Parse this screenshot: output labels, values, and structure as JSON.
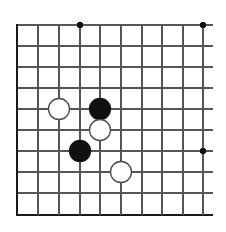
{
  "figure": {
    "kind": "go-board-diagram",
    "width": 226,
    "height": 232,
    "background_color": "#ffffff"
  },
  "board": {
    "grid_line_color": "#555555",
    "edge_line_color": "#1a1a1a",
    "grid_line_width": 1.3,
    "edge_line_width": 2.6,
    "cropped": true,
    "cropped_edges": [
      "top",
      "right"
    ],
    "columns": 10,
    "rows": 10,
    "column_x": [
      17,
      38,
      59,
      80,
      100,
      121,
      142,
      162,
      183,
      203
    ],
    "row_y": [
      25,
      46,
      67,
      88,
      109,
      130,
      151,
      172,
      193,
      215
    ],
    "line_overhang_right": 10,
    "line_overhang_top": 0,
    "edges": {
      "left_index": 0,
      "bottom_index": 9
    },
    "star_points": [
      {
        "name": "star-point-top-left",
        "col": 3,
        "row": 0
      },
      {
        "name": "star-point-top-right",
        "col": 9,
        "row": 0
      },
      {
        "name": "star-point-right",
        "col": 9,
        "row": 6
      }
    ],
    "star_point_radius": 3.1,
    "star_point_color": "#111111"
  },
  "stones": {
    "radius": 10.5,
    "black_fill": "#111111",
    "black_stroke": "#111111",
    "white_fill": "#ffffff",
    "white_stroke": "#4a4a4a",
    "stroke_width": 1.3,
    "items": [
      {
        "name": "white-stone-1",
        "color": "white",
        "col": 2,
        "row": 4
      },
      {
        "name": "black-stone-1",
        "color": "black",
        "col": 4,
        "row": 4
      },
      {
        "name": "white-stone-2",
        "color": "white",
        "col": 4,
        "row": 5
      },
      {
        "name": "black-stone-2",
        "color": "black",
        "col": 3,
        "row": 6
      },
      {
        "name": "white-stone-3",
        "color": "white",
        "col": 5,
        "row": 7
      }
    ]
  }
}
